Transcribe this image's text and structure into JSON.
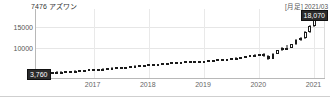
{
  "header": {
    "ticker_code": "7476",
    "company_name": "アズワン",
    "title": "7476 アズワン",
    "period_label": "[月足] 2021/03"
  },
  "badges": {
    "last_price": "18,070",
    "first_price": "3,760"
  },
  "colors": {
    "up_body": "#ffffff",
    "down_body": "#1a1a1a",
    "outline": "#1a1a1a",
    "grid": "#e6e6e6",
    "axis": "#b8b8b8",
    "badge_bg": "#2b2b2b",
    "badge_text": "#ffffff"
  },
  "chart_data": {
    "type": "line",
    "chart_subtype": "candlestick",
    "title": "7476 アズワン",
    "subtitle": "[月足] 2021/03",
    "xlabel": "",
    "ylabel": "",
    "grid": true,
    "legend": "none",
    "ylim": [
      2500,
      19500
    ],
    "yticks": [
      10000,
      15000
    ],
    "ytick_labels": [
      "10000",
      "15000"
    ],
    "xticks": [
      "2017",
      "2018",
      "2019",
      "2020",
      "2021"
    ],
    "xlim": [
      "2016-01",
      "2021-03"
    ],
    "annotations": [
      {
        "text": "18,070",
        "role": "last-price-badge",
        "position": "top-right"
      },
      {
        "text": "3,760",
        "role": "first-price-badge",
        "position": "bottom-left"
      }
    ],
    "candles": [
      {
        "t": "2016-01",
        "o": 3760,
        "h": 3900,
        "l": 3600,
        "c": 3820,
        "dir": "up"
      },
      {
        "t": "2016-02",
        "o": 3820,
        "h": 3950,
        "l": 3700,
        "c": 3760,
        "dir": "down"
      },
      {
        "t": "2016-03",
        "o": 3760,
        "h": 3980,
        "l": 3720,
        "c": 3900,
        "dir": "up"
      },
      {
        "t": "2016-04",
        "o": 3900,
        "h": 4050,
        "l": 3840,
        "c": 3980,
        "dir": "up"
      },
      {
        "t": "2016-05",
        "o": 3980,
        "h": 4120,
        "l": 3900,
        "c": 4050,
        "dir": "up"
      },
      {
        "t": "2016-06",
        "o": 4050,
        "h": 4150,
        "l": 3880,
        "c": 3950,
        "dir": "down"
      },
      {
        "t": "2016-07",
        "o": 3950,
        "h": 4200,
        "l": 3920,
        "c": 4150,
        "dir": "up"
      },
      {
        "t": "2016-08",
        "o": 4150,
        "h": 4300,
        "l": 4080,
        "c": 4230,
        "dir": "up"
      },
      {
        "t": "2016-09",
        "o": 4230,
        "h": 4380,
        "l": 4150,
        "c": 4300,
        "dir": "up"
      },
      {
        "t": "2016-10",
        "o": 4300,
        "h": 4450,
        "l": 4220,
        "c": 4400,
        "dir": "up"
      },
      {
        "t": "2016-11",
        "o": 4400,
        "h": 4560,
        "l": 4330,
        "c": 4500,
        "dir": "up"
      },
      {
        "t": "2016-12",
        "o": 4500,
        "h": 4700,
        "l": 4450,
        "c": 4620,
        "dir": "up"
      },
      {
        "t": "2017-01",
        "o": 4620,
        "h": 4780,
        "l": 4540,
        "c": 4700,
        "dir": "up"
      },
      {
        "t": "2017-02",
        "o": 4700,
        "h": 4820,
        "l": 4600,
        "c": 4650,
        "dir": "down"
      },
      {
        "t": "2017-03",
        "o": 4650,
        "h": 4850,
        "l": 4600,
        "c": 4800,
        "dir": "up"
      },
      {
        "t": "2017-04",
        "o": 4800,
        "h": 4980,
        "l": 4720,
        "c": 4900,
        "dir": "up"
      },
      {
        "t": "2017-05",
        "o": 4900,
        "h": 5100,
        "l": 4850,
        "c": 5020,
        "dir": "up"
      },
      {
        "t": "2017-06",
        "o": 5020,
        "h": 5200,
        "l": 4950,
        "c": 5150,
        "dir": "up"
      },
      {
        "t": "2017-07",
        "o": 5150,
        "h": 5280,
        "l": 5020,
        "c": 5080,
        "dir": "down"
      },
      {
        "t": "2017-08",
        "o": 5080,
        "h": 5300,
        "l": 5020,
        "c": 5250,
        "dir": "up"
      },
      {
        "t": "2017-09",
        "o": 5250,
        "h": 5450,
        "l": 5180,
        "c": 5380,
        "dir": "up"
      },
      {
        "t": "2017-10",
        "o": 5380,
        "h": 5600,
        "l": 5320,
        "c": 5520,
        "dir": "up"
      },
      {
        "t": "2017-11",
        "o": 5520,
        "h": 5720,
        "l": 5450,
        "c": 5650,
        "dir": "up"
      },
      {
        "t": "2017-12",
        "o": 5650,
        "h": 5800,
        "l": 5560,
        "c": 5700,
        "dir": "up"
      },
      {
        "t": "2018-01",
        "o": 5700,
        "h": 5950,
        "l": 5620,
        "c": 5880,
        "dir": "up"
      },
      {
        "t": "2018-02",
        "o": 5880,
        "h": 6000,
        "l": 5700,
        "c": 5760,
        "dir": "down"
      },
      {
        "t": "2018-03",
        "o": 5760,
        "h": 5980,
        "l": 5680,
        "c": 5900,
        "dir": "up"
      },
      {
        "t": "2018-04",
        "o": 5900,
        "h": 6150,
        "l": 5850,
        "c": 6080,
        "dir": "up"
      },
      {
        "t": "2018-05",
        "o": 6080,
        "h": 6280,
        "l": 6000,
        "c": 6200,
        "dir": "up"
      },
      {
        "t": "2018-06",
        "o": 6200,
        "h": 6400,
        "l": 6120,
        "c": 6320,
        "dir": "up"
      },
      {
        "t": "2018-07",
        "o": 6320,
        "h": 6500,
        "l": 6200,
        "c": 6260,
        "dir": "down"
      },
      {
        "t": "2018-08",
        "o": 6260,
        "h": 6550,
        "l": 6200,
        "c": 6480,
        "dir": "up"
      },
      {
        "t": "2018-09",
        "o": 6480,
        "h": 6750,
        "l": 6400,
        "c": 6650,
        "dir": "up"
      },
      {
        "t": "2018-10",
        "o": 6650,
        "h": 6800,
        "l": 6300,
        "c": 6420,
        "dir": "down"
      },
      {
        "t": "2018-11",
        "o": 6420,
        "h": 6700,
        "l": 6350,
        "c": 6620,
        "dir": "up"
      },
      {
        "t": "2018-12",
        "o": 6620,
        "h": 6800,
        "l": 6250,
        "c": 6380,
        "dir": "down"
      },
      {
        "t": "2019-01",
        "o": 6380,
        "h": 6700,
        "l": 6300,
        "c": 6600,
        "dir": "up"
      },
      {
        "t": "2019-02",
        "o": 6600,
        "h": 6900,
        "l": 6520,
        "c": 6820,
        "dir": "up"
      },
      {
        "t": "2019-03",
        "o": 6820,
        "h": 7050,
        "l": 6750,
        "c": 6950,
        "dir": "up"
      },
      {
        "t": "2019-04",
        "o": 6950,
        "h": 7200,
        "l": 6880,
        "c": 7100,
        "dir": "up"
      },
      {
        "t": "2019-05",
        "o": 7100,
        "h": 7250,
        "l": 6900,
        "c": 6980,
        "dir": "down"
      },
      {
        "t": "2019-06",
        "o": 6980,
        "h": 7300,
        "l": 6920,
        "c": 7220,
        "dir": "up"
      },
      {
        "t": "2019-07",
        "o": 7220,
        "h": 7500,
        "l": 7150,
        "c": 7400,
        "dir": "up"
      },
      {
        "t": "2019-08",
        "o": 7400,
        "h": 7600,
        "l": 7200,
        "c": 7300,
        "dir": "down"
      },
      {
        "t": "2019-09",
        "o": 7300,
        "h": 7700,
        "l": 7250,
        "c": 7620,
        "dir": "up"
      },
      {
        "t": "2019-10",
        "o": 7620,
        "h": 7950,
        "l": 7550,
        "c": 7880,
        "dir": "up"
      },
      {
        "t": "2019-11",
        "o": 7880,
        "h": 8150,
        "l": 7800,
        "c": 8050,
        "dir": "up"
      },
      {
        "t": "2019-12",
        "o": 8050,
        "h": 8300,
        "l": 7950,
        "c": 8200,
        "dir": "up"
      },
      {
        "t": "2020-01",
        "o": 8200,
        "h": 8500,
        "l": 8100,
        "c": 8400,
        "dir": "up"
      },
      {
        "t": "2020-02",
        "o": 8400,
        "h": 8600,
        "l": 7600,
        "c": 7800,
        "dir": "down"
      },
      {
        "t": "2020-03",
        "o": 7800,
        "h": 8200,
        "l": 6900,
        "c": 7200,
        "dir": "down"
      },
      {
        "t": "2020-04",
        "o": 7200,
        "h": 8600,
        "l": 7100,
        "c": 8500,
        "dir": "up"
      },
      {
        "t": "2020-05",
        "o": 8500,
        "h": 9500,
        "l": 8400,
        "c": 9350,
        "dir": "up"
      },
      {
        "t": "2020-06",
        "o": 9350,
        "h": 10200,
        "l": 9200,
        "c": 10000,
        "dir": "up"
      },
      {
        "t": "2020-07",
        "o": 10000,
        "h": 10600,
        "l": 9600,
        "c": 9900,
        "dir": "down"
      },
      {
        "t": "2020-08",
        "o": 9900,
        "h": 11000,
        "l": 9800,
        "c": 10800,
        "dir": "up"
      },
      {
        "t": "2020-09",
        "o": 10800,
        "h": 12000,
        "l": 10600,
        "c": 11800,
        "dir": "up"
      },
      {
        "t": "2020-10",
        "o": 11800,
        "h": 12600,
        "l": 11500,
        "c": 12300,
        "dir": "up"
      },
      {
        "t": "2020-11",
        "o": 12300,
        "h": 14000,
        "l": 12200,
        "c": 13800,
        "dir": "up"
      },
      {
        "t": "2020-12",
        "o": 13800,
        "h": 15500,
        "l": 13600,
        "c": 15200,
        "dir": "up"
      },
      {
        "t": "2021-01",
        "o": 15200,
        "h": 18500,
        "l": 15000,
        "c": 18200,
        "dir": "up"
      },
      {
        "t": "2021-02",
        "o": 18200,
        "h": 19000,
        "l": 16500,
        "c": 17000,
        "dir": "down"
      },
      {
        "t": "2021-03",
        "o": 17000,
        "h": 18600,
        "l": 16800,
        "c": 18070,
        "dir": "up"
      }
    ]
  }
}
